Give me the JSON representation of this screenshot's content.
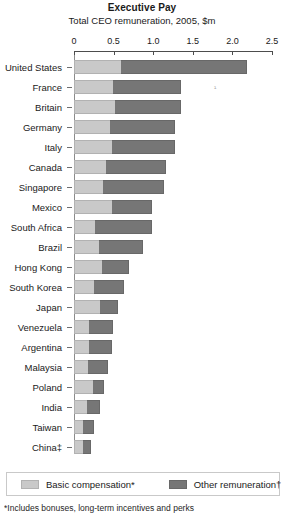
{
  "chart_data": {
    "type": "bar",
    "orientation": "horizontal",
    "stacked": true,
    "title": "Executive Pay",
    "subtitle": "Total CEO remuneration, 2005, $m",
    "xlabel": "",
    "ylabel": "",
    "xlim": [
      0,
      2.5
    ],
    "xticks": [
      0,
      0.5,
      1.0,
      1.5,
      2.0,
      2.5
    ],
    "xtick_labels": [
      "0",
      "0.5",
      "1.0",
      "1.5",
      "2.0",
      "2.5"
    ],
    "grid": false,
    "legend_position": "bottom",
    "categories": [
      "United States",
      "France",
      "Britain",
      "Germany",
      "Italy",
      "Canada",
      "Singapore",
      "Mexico",
      "South Africa",
      "Brazil",
      "Hong Kong",
      "South Korea",
      "Japan",
      "Venezuela",
      "Argentina",
      "Malaysia",
      "Poland",
      "India",
      "Taiwan",
      "China‡"
    ],
    "series": [
      {
        "name": "Basic compensation*",
        "color": "#c9c9c9",
        "values": [
          0.59,
          0.49,
          0.52,
          0.46,
          0.48,
          0.4,
          0.37,
          0.48,
          0.26,
          0.31,
          0.35,
          0.25,
          0.33,
          0.19,
          0.19,
          0.18,
          0.24,
          0.16,
          0.11,
          0.11
        ]
      },
      {
        "name": "Other remuneration†",
        "color": "#767676",
        "values": [
          1.59,
          0.86,
          0.83,
          0.82,
          0.8,
          0.76,
          0.77,
          0.5,
          0.72,
          0.56,
          0.34,
          0.38,
          0.23,
          0.3,
          0.29,
          0.25,
          0.14,
          0.17,
          0.14,
          0.1
        ]
      }
    ],
    "totals": [
      2.18,
      1.35,
      1.35,
      1.28,
      1.28,
      1.16,
      1.14,
      0.98,
      0.98,
      0.87,
      0.69,
      0.63,
      0.56,
      0.49,
      0.48,
      0.43,
      0.38,
      0.33,
      0.25,
      0.21
    ]
  },
  "legend": {
    "items": [
      {
        "label": "Basic compensation*"
      },
      {
        "label": "Other remuneration†"
      }
    ]
  },
  "footnote": {
    "text": "*Includes bonuses, long-term incentives and perks"
  },
  "annotations": {
    "mark_a": "¹"
  },
  "colors": {
    "basic": "#c9c9c9",
    "other": "#767676",
    "axis": "#4d4d4d",
    "text": "#1a1a1a",
    "background": "#ffffff"
  }
}
